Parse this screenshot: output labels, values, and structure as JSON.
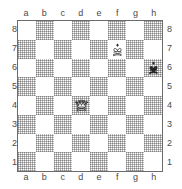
{
  "board": {
    "files": [
      "a",
      "b",
      "c",
      "d",
      "e",
      "f",
      "g",
      "h"
    ],
    "ranks": [
      "8",
      "7",
      "6",
      "5",
      "4",
      "3",
      "2",
      "1"
    ],
    "size": 8,
    "orientation": "white",
    "light_square_color": "#ffffff",
    "dark_square_color": "#b9b9b9",
    "border_color": "#6b6b6b",
    "coord_color": "#4a4a4a",
    "squares": [
      {
        "square": "f7",
        "piece": "white-king",
        "color": "white",
        "type": "king",
        "glyph": "♔"
      },
      {
        "square": "h6",
        "piece": "black-king",
        "color": "black",
        "type": "king",
        "glyph": "♚"
      },
      {
        "square": "d4",
        "piece": "white-queen",
        "color": "white",
        "type": "queen",
        "glyph": "♕"
      }
    ],
    "fen": "8/5K2/7k/8/3Q4/8/8/8 w - - 0 1"
  }
}
